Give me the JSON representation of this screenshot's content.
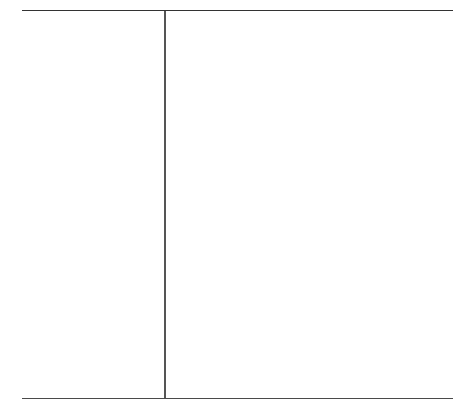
{
  "table": {
    "columns": [
      {
        "content": ""
      },
      {
        "content": ""
      }
    ],
    "colors": {
      "rule": "#333333",
      "divider": "#555555",
      "background": "#ffffff"
    }
  }
}
